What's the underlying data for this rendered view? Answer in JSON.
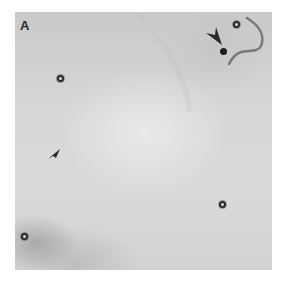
{
  "figure": {
    "panel_label": "A",
    "colors": {
      "background": "#d6d6d6",
      "marker": "#2b2b2b",
      "arrowhead": "#2a2a2a"
    },
    "markers": [
      {
        "name": "circle-marker-1",
        "x": 45,
        "y": 66
      },
      {
        "name": "circle-marker-2",
        "x": 221,
        "y": 12
      },
      {
        "name": "circle-marker-3",
        "x": 9,
        "y": 224
      },
      {
        "name": "circle-marker-4",
        "x": 207,
        "y": 192
      }
    ],
    "arrowheads": [
      {
        "name": "large-arrowhead",
        "x": 193,
        "y": 18,
        "direction": "down-right"
      },
      {
        "name": "small-arrowhead",
        "x": 36,
        "y": 138,
        "direction": "up-right"
      }
    ],
    "dense_dot": {
      "x": 208,
      "y": 38
    }
  }
}
